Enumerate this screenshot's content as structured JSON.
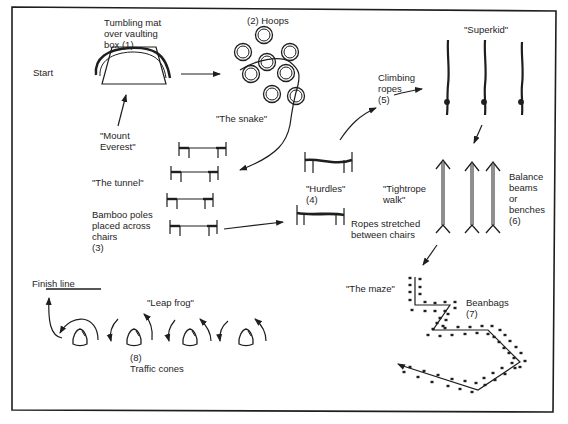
{
  "diagram": {
    "type": "obstacle-course",
    "stations": [
      {
        "number": "(1)",
        "name": "Tumbling mat over vaulting box",
        "nickname": "\"Mount Everest\""
      },
      {
        "number": "(2)",
        "name": "Hoops",
        "nickname": "\"The snake\""
      },
      {
        "number": "(3)",
        "name": "Bamboo poles placed across chairs",
        "nickname": "\"The tunnel\""
      },
      {
        "number": "(4)",
        "name": "Ropes stretched between chairs",
        "nickname": "\"Hurdles\""
      },
      {
        "number": "(5)",
        "name": "Climbing ropes",
        "nickname": "\"Superkid\""
      },
      {
        "number": "(6)",
        "name": "Balance beams or benches",
        "nickname": "\"Tightrope walk\""
      },
      {
        "number": "(7)",
        "name": "Beanbags",
        "nickname": "\"The maze\""
      },
      {
        "number": "(8)",
        "name": "Traffic cones",
        "nickname": "\"Leap frog\""
      }
    ]
  },
  "labels": {
    "start": "Start",
    "finish": "Finish line",
    "station1": "Tumbling mat\nover vaulting\nbox      (1)",
    "mount_everest": "\"Mount\n Everest\"",
    "station2": "(2)  Hoops",
    "snake": "\"The snake\"",
    "tunnel": "\"The tunnel\"",
    "station3": "Bamboo poles\nplaced across\nchairs\n(3)",
    "hurdles": "\"Hurdles\"\n(4)",
    "station4": "Ropes stretched\nbetween chairs",
    "station5": "Climbing\nropes\n(5)",
    "superkid": "\"Superkid\"",
    "tightrope": "\"Tightrope\nwalk\"",
    "station6": "Balance\nbeams\nor\nbenches\n(6)",
    "maze": "\"The maze\"",
    "station7": "Beanbags\n(7)",
    "leapfrog": "\"Leap frog\"",
    "station8": "(8)\nTraffic cones"
  },
  "colors": {
    "ink": "#1e1e1e",
    "background": "#ffffff"
  }
}
